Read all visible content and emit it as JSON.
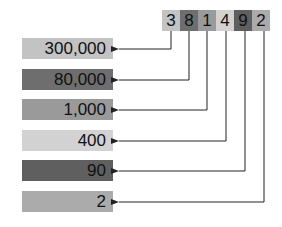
{
  "number": {
    "digits": [
      {
        "value": "3",
        "color": "#c3c3c3"
      },
      {
        "value": "8",
        "color": "#6e6e6e"
      },
      {
        "value": "1",
        "color": "#9a9a9a"
      },
      {
        "value": "4",
        "color": "#d2d2d2"
      },
      {
        "value": "9",
        "color": "#5f5f5f"
      },
      {
        "value": "2",
        "color": "#ababab"
      }
    ]
  },
  "place_values": [
    {
      "label": "300,000",
      "color": "#c3c3c3"
    },
    {
      "label": "80,000",
      "color": "#6e6e6e"
    },
    {
      "label": "1,000",
      "color": "#9a9a9a"
    },
    {
      "label": "400",
      "color": "#d2d2d2"
    },
    {
      "label": "90",
      "color": "#5f5f5f"
    },
    {
      "label": "2",
      "color": "#ababab"
    }
  ]
}
